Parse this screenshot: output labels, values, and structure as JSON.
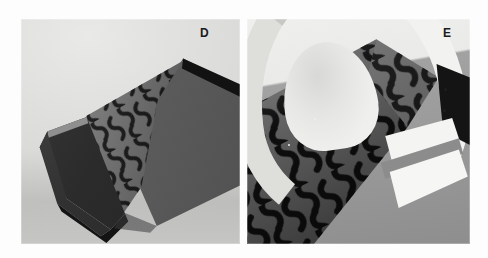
{
  "figure": {
    "caption_labels": [
      "D",
      "E"
    ],
    "background_color": "#fdfdfd",
    "width": 488,
    "height": 258,
    "panels": [
      {
        "id": "D",
        "label": "D",
        "subject": "folded dark-grey sheet forming an open box-like corner, inner face covered in a repeating dumbbell (peanut) lattice pattern",
        "background_color": "#d9d9d8",
        "object_colors": {
          "outer_wall": "#5e5e5e",
          "fold_flap": "#2b2b2b",
          "rim": "#121212",
          "pattern_field": "#7f7f7f",
          "pattern_ink": "#1a1a1a"
        }
      },
      {
        "id": "E",
        "label": "E",
        "subject": "close-up of a white curved arch strip rising above a dark patterned slab, with lit white facets at the lower right",
        "background_color": "#9e9e9e",
        "object_colors": {
          "arch": "#f2f2f0",
          "slab": "#6d6d6d",
          "dark_wedge": "#141414",
          "lit_facet": "#f5f5f3",
          "pattern_ink": "#141414"
        }
      }
    ],
    "pattern": {
      "name": "dumbbell-lattice",
      "description": "repeating outlined dumbbell / peanut shaped cells tiled in offset rows",
      "ink_color": "#161616"
    }
  }
}
